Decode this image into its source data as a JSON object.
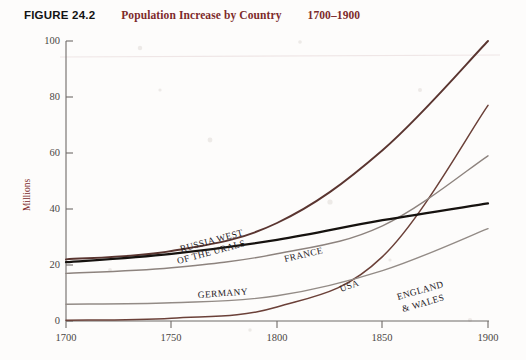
{
  "header": {
    "figure_number": "FIGURE 24.2",
    "title": "Population Increase by Country",
    "range": "1700–1900",
    "number_color": "#131313",
    "title_color": "#7d2b2b"
  },
  "axes": {
    "ylabel": "Millions",
    "ylabel_color": "#7d2b2b",
    "y_ticks": [
      "0",
      "20",
      "40",
      "60",
      "80",
      "100"
    ],
    "x_ticks": [
      "1700",
      "1750",
      "1800",
      "1850",
      "1900"
    ],
    "axis_color": "#6f6a68"
  },
  "labels": {
    "russia": "RUSSIA WEST",
    "russia2": "OF THE URALS",
    "france": "FRANCE",
    "germany": "GERMANY",
    "usa": "USA",
    "england": "ENGLAND",
    "england2": "& WALES"
  },
  "chart_data": {
    "type": "line",
    "title": "Population Increase by Country 1700–1900",
    "xlabel": "",
    "ylabel": "Millions",
    "x": [
      1700,
      1750,
      1800,
      1850,
      1900
    ],
    "xlim": [
      1700,
      1900
    ],
    "ylim": [
      0,
      100
    ],
    "x_ticks": [
      1700,
      1750,
      1800,
      1850,
      1900
    ],
    "y_ticks": [
      0,
      20,
      40,
      60,
      80,
      100
    ],
    "grid": false,
    "legend": "inline-annotations",
    "units": "millions of people",
    "series": [
      {
        "name": "RUSSIA WEST OF THE URALS",
        "values": [
          22,
          25,
          35,
          61,
          100
        ],
        "color": "#5a3530",
        "width": 1.9
      },
      {
        "name": "USA",
        "values": [
          0.3,
          1,
          5,
          23,
          77
        ],
        "color": "#6b4038",
        "width": 1.5
      },
      {
        "name": "GERMANY",
        "values": [
          17,
          19,
          24,
          34,
          59
        ],
        "color": "#8d837e",
        "width": 1.4
      },
      {
        "name": "FRANCE",
        "values": [
          21,
          24,
          29,
          36,
          42
        ],
        "color": "#16120f",
        "width": 2.2
      },
      {
        "name": "ENGLAND & WALES",
        "values": [
          6,
          6.5,
          9,
          18,
          33
        ],
        "color": "#938b86",
        "width": 1.4
      }
    ]
  }
}
